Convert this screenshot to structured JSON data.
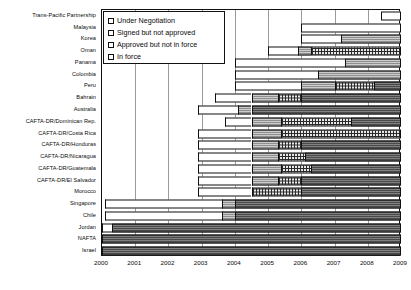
{
  "chart_data": {
    "type": "bar",
    "title": "",
    "xlabel": "",
    "ylabel": "",
    "orientation": "horizontal",
    "xlim": [
      2000,
      2009
    ],
    "xticks": [
      "2000",
      "2001",
      "2002",
      "2003",
      "2004",
      "2005",
      "2006",
      "2007",
      "2008",
      "2009"
    ],
    "grid": true,
    "stacked": true,
    "legend_position": "top-left",
    "legend": [
      {
        "key": "negotiation",
        "label": "Under  Negotiation",
        "fill": "white"
      },
      {
        "key": "signed",
        "label": "Signed but not approved",
        "fill": "gray-lines"
      },
      {
        "key": "approved",
        "label": "Approved but not in force",
        "fill": "dotted"
      },
      {
        "key": "inforce",
        "label": "In force",
        "fill": "dark-gray"
      }
    ],
    "categories": [
      "Trans-Pacific Partnership",
      "Malaysia",
      "Korea",
      "Oman",
      "Panama",
      "Colombia",
      "Peru",
      "Bahrain",
      "Australia",
      "CAFTA-DR/Dominican Rep.",
      "CAFTA-DR/Costa Rica",
      "CAFTA-DR/Honduras",
      "CAFTA-DR/Nicaragua",
      "CAFTA-DR/Guatemala",
      "CAFTA-DR/El Salvador",
      "Morocco",
      "Singapore",
      "Chile",
      "Jordan",
      "NAFTA",
      "Israel"
    ],
    "rows": [
      {
        "category": "Trans-Pacific Partnership",
        "segments": [
          {
            "status": "negotiation",
            "start": 2008.4,
            "end": 2009.0
          }
        ]
      },
      {
        "category": "Malaysia",
        "segments": [
          {
            "status": "negotiation",
            "start": 2006.0,
            "end": 2009.0
          }
        ]
      },
      {
        "category": "Korea",
        "segments": [
          {
            "status": "negotiation",
            "start": 2006.0,
            "end": 2007.2
          },
          {
            "status": "signed",
            "start": 2007.2,
            "end": 2009.0
          }
        ]
      },
      {
        "category": "Oman",
        "segments": [
          {
            "status": "negotiation",
            "start": 2005.0,
            "end": 2005.9
          },
          {
            "status": "signed",
            "start": 2005.9,
            "end": 2006.3
          },
          {
            "status": "approved",
            "start": 2006.3,
            "end": 2009.0
          }
        ]
      },
      {
        "category": "Panama",
        "segments": [
          {
            "status": "negotiation",
            "start": 2004.0,
            "end": 2007.3
          },
          {
            "status": "signed",
            "start": 2007.3,
            "end": 2009.0
          }
        ]
      },
      {
        "category": "Colombia",
        "segments": [
          {
            "status": "negotiation",
            "start": 2004.0,
            "end": 2006.5
          },
          {
            "status": "signed",
            "start": 2006.5,
            "end": 2009.0
          }
        ]
      },
      {
        "category": "Peru",
        "segments": [
          {
            "status": "negotiation",
            "start": 2004.0,
            "end": 2006.0
          },
          {
            "status": "signed",
            "start": 2006.0,
            "end": 2007.0
          },
          {
            "status": "approved",
            "start": 2007.0,
            "end": 2008.2
          },
          {
            "status": "inforce",
            "start": 2008.2,
            "end": 2009.0
          }
        ]
      },
      {
        "category": "Bahrain",
        "segments": [
          {
            "status": "negotiation",
            "start": 2003.4,
            "end": 2004.5
          },
          {
            "status": "signed",
            "start": 2004.5,
            "end": 2005.3
          },
          {
            "status": "approved",
            "start": 2005.3,
            "end": 2006.0
          },
          {
            "status": "inforce",
            "start": 2006.0,
            "end": 2009.0
          }
        ]
      },
      {
        "category": "Australia",
        "segments": [
          {
            "status": "negotiation",
            "start": 2002.9,
            "end": 2004.1
          },
          {
            "status": "signed",
            "start": 2004.1,
            "end": 2004.5
          },
          {
            "status": "inforce",
            "start": 2004.5,
            "end": 2009.0
          }
        ]
      },
      {
        "category": "CAFTA-DR/Dominican Rep.",
        "segments": [
          {
            "status": "negotiation",
            "start": 2003.7,
            "end": 2004.5
          },
          {
            "status": "signed",
            "start": 2004.5,
            "end": 2005.4
          },
          {
            "status": "approved",
            "start": 2005.4,
            "end": 2007.5
          },
          {
            "status": "inforce",
            "start": 2007.5,
            "end": 2009.0
          }
        ]
      },
      {
        "category": "CAFTA-DR/Costa Rica",
        "segments": [
          {
            "status": "negotiation",
            "start": 2002.9,
            "end": 2004.5
          },
          {
            "status": "signed",
            "start": 2004.5,
            "end": 2005.4
          },
          {
            "status": "approved",
            "start": 2005.4,
            "end": 2009.0
          }
        ]
      },
      {
        "category": "CAFTA-DR/Honduras",
        "segments": [
          {
            "status": "negotiation",
            "start": 2002.9,
            "end": 2004.5
          },
          {
            "status": "signed",
            "start": 2004.5,
            "end": 2005.3
          },
          {
            "status": "approved",
            "start": 2005.3,
            "end": 2006.0
          },
          {
            "status": "inforce",
            "start": 2006.0,
            "end": 2009.0
          }
        ]
      },
      {
        "category": "CAFTA-DR/Nicaragua",
        "segments": [
          {
            "status": "negotiation",
            "start": 2002.9,
            "end": 2004.5
          },
          {
            "status": "signed",
            "start": 2004.5,
            "end": 2005.3
          },
          {
            "status": "approved",
            "start": 2005.3,
            "end": 2006.1
          },
          {
            "status": "inforce",
            "start": 2006.1,
            "end": 2009.0
          }
        ]
      },
      {
        "category": "CAFTA-DR/Guatemala",
        "segments": [
          {
            "status": "negotiation",
            "start": 2002.9,
            "end": 2004.5
          },
          {
            "status": "signed",
            "start": 2004.5,
            "end": 2005.4
          },
          {
            "status": "approved",
            "start": 2005.4,
            "end": 2006.3
          },
          {
            "status": "inforce",
            "start": 2006.3,
            "end": 2009.0
          }
        ]
      },
      {
        "category": "CAFTA-DR/El Salvador",
        "segments": [
          {
            "status": "negotiation",
            "start": 2002.9,
            "end": 2004.5
          },
          {
            "status": "signed",
            "start": 2004.5,
            "end": 2005.3
          },
          {
            "status": "approved",
            "start": 2005.3,
            "end": 2006.0
          },
          {
            "status": "inforce",
            "start": 2006.0,
            "end": 2009.0
          }
        ]
      },
      {
        "category": "Morocco",
        "segments": [
          {
            "status": "negotiation",
            "start": 2002.9,
            "end": 2004.5
          },
          {
            "status": "approved",
            "start": 2004.5,
            "end": 2006.0
          },
          {
            "status": "inforce",
            "start": 2006.0,
            "end": 2009.0
          }
        ]
      },
      {
        "category": "Singapore",
        "segments": [
          {
            "status": "negotiation",
            "start": 2000.1,
            "end": 2003.6
          },
          {
            "status": "signed",
            "start": 2003.6,
            "end": 2004.0
          },
          {
            "status": "inforce",
            "start": 2004.0,
            "end": 2009.0
          }
        ]
      },
      {
        "category": "Chile",
        "segments": [
          {
            "status": "negotiation",
            "start": 2000.1,
            "end": 2003.6
          },
          {
            "status": "signed",
            "start": 2003.6,
            "end": 2004.0
          },
          {
            "status": "inforce",
            "start": 2004.0,
            "end": 2009.0
          }
        ]
      },
      {
        "category": "Jordan",
        "segments": [
          {
            "status": "negotiation",
            "start": 1999.8,
            "end": 2000.3
          },
          {
            "status": "inforce",
            "start": 2000.3,
            "end": 2009.0
          }
        ]
      },
      {
        "category": "NAFTA",
        "segments": [
          {
            "status": "inforce",
            "start": 2000.0,
            "end": 2009.0
          }
        ]
      },
      {
        "category": "Israel",
        "segments": [
          {
            "status": "inforce",
            "start": 2000.0,
            "end": 2009.0
          }
        ]
      }
    ]
  }
}
